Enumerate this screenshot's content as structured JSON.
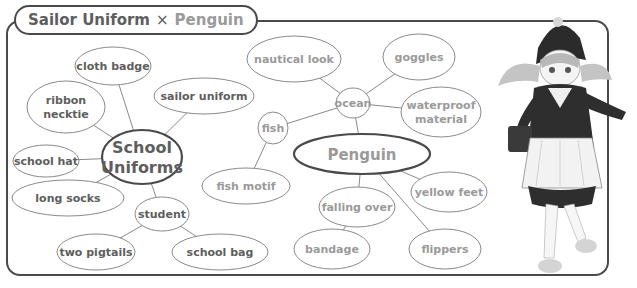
{
  "title": {
    "part1": "Sailor Uniform",
    "separator": "×",
    "part2": "Penguin"
  },
  "colors": {
    "frame": "#4a4a4a",
    "uniform_text": "#5e5e5e",
    "penguin_text": "#9a9a9a",
    "edge": "#8a8a8a"
  },
  "hubs": [
    {
      "id": "school-uniforms",
      "lines": [
        "School",
        "Uniforms"
      ],
      "group": "uniform"
    },
    {
      "id": "penguin",
      "lines": [
        "Penguin"
      ],
      "group": "penguin"
    }
  ],
  "nodes": [
    {
      "id": "cloth-badge",
      "lines": [
        "cloth badge"
      ],
      "group": "uniform"
    },
    {
      "id": "ribbon-necktie",
      "lines": [
        "ribbon",
        "necktie"
      ],
      "group": "uniform"
    },
    {
      "id": "sailor-uniform",
      "lines": [
        "sailor uniform"
      ],
      "group": "uniform"
    },
    {
      "id": "school-hat",
      "lines": [
        "school hat"
      ],
      "group": "uniform"
    },
    {
      "id": "long-socks",
      "lines": [
        "long socks"
      ],
      "group": "uniform"
    },
    {
      "id": "student",
      "lines": [
        "student"
      ],
      "group": "uniform"
    },
    {
      "id": "two-pigtails",
      "lines": [
        "two pigtails"
      ],
      "group": "uniform"
    },
    {
      "id": "school-bag",
      "lines": [
        "school bag"
      ],
      "group": "uniform"
    },
    {
      "id": "nautical-look",
      "lines": [
        "nautical look"
      ],
      "group": "penguin"
    },
    {
      "id": "goggles",
      "lines": [
        "goggles"
      ],
      "group": "penguin"
    },
    {
      "id": "ocean",
      "lines": [
        "ocean"
      ],
      "group": "penguin"
    },
    {
      "id": "waterproof-material",
      "lines": [
        "waterproof",
        "material"
      ],
      "group": "penguin"
    },
    {
      "id": "fish",
      "lines": [
        "fish"
      ],
      "group": "penguin"
    },
    {
      "id": "fish-motif",
      "lines": [
        "fish motif"
      ],
      "group": "penguin"
    },
    {
      "id": "falling-over",
      "lines": [
        "falling over"
      ],
      "group": "penguin"
    },
    {
      "id": "yellow-feet",
      "lines": [
        "yellow feet"
      ],
      "group": "penguin"
    },
    {
      "id": "bandage",
      "lines": [
        "bandage"
      ],
      "group": "penguin"
    },
    {
      "id": "flippers",
      "lines": [
        "flippers"
      ],
      "group": "penguin"
    }
  ],
  "edges": [
    [
      "school-uniforms",
      "cloth-badge"
    ],
    [
      "school-uniforms",
      "ribbon-necktie"
    ],
    [
      "school-uniforms",
      "sailor-uniform"
    ],
    [
      "school-uniforms",
      "school-hat"
    ],
    [
      "school-uniforms",
      "long-socks"
    ],
    [
      "school-uniforms",
      "student"
    ],
    [
      "student",
      "two-pigtails"
    ],
    [
      "student",
      "school-bag"
    ],
    [
      "penguin",
      "ocean"
    ],
    [
      "ocean",
      "nautical-look"
    ],
    [
      "ocean",
      "goggles"
    ],
    [
      "ocean",
      "waterproof-material"
    ],
    [
      "ocean",
      "fish"
    ],
    [
      "fish",
      "fish-motif"
    ],
    [
      "penguin",
      "falling-over"
    ],
    [
      "falling-over",
      "bandage"
    ],
    [
      "penguin",
      "yellow-feet"
    ],
    [
      "penguin",
      "flippers"
    ]
  ],
  "illustration": {
    "description": "anime girl in penguin-themed sailor uniform with hood and twin pigtails"
  }
}
